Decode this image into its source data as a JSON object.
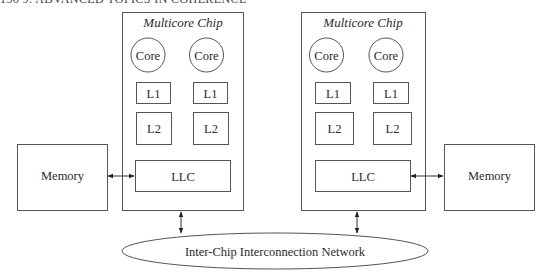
{
  "header": {
    "text": "156    9. ADVANCED TOPICS IN COHERENCE"
  },
  "chips": [
    {
      "title": "Multicore Chip",
      "cores": [
        {
          "label": "Core"
        },
        {
          "label": "Core"
        }
      ],
      "l1": [
        {
          "label": "L1"
        },
        {
          "label": "L1"
        }
      ],
      "l2": [
        {
          "label": "L2"
        },
        {
          "label": "L2"
        }
      ],
      "llc": {
        "label": "LLC"
      },
      "memory": {
        "label": "Memory"
      }
    },
    {
      "title": "Multicore Chip",
      "cores": [
        {
          "label": "Core"
        },
        {
          "label": "Core"
        }
      ],
      "l1": [
        {
          "label": "L1"
        },
        {
          "label": "L1"
        }
      ],
      "l2": [
        {
          "label": "L2"
        },
        {
          "label": "L2"
        }
      ],
      "llc": {
        "label": "LLC"
      },
      "memory": {
        "label": "Memory"
      }
    }
  ],
  "network": {
    "label": "Inter-Chip Interconnection Network"
  }
}
